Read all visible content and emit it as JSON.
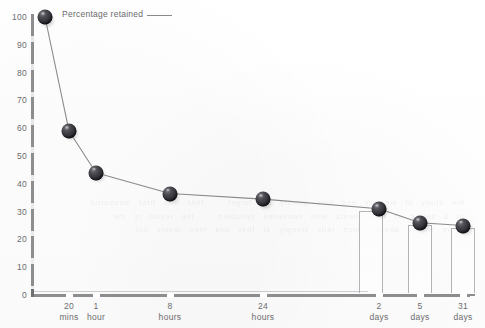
{
  "chart_data": {
    "type": "line",
    "title": "",
    "xlabel": "",
    "ylabel": "",
    "ylim": [
      0,
      100
    ],
    "grid": false,
    "legend_position": "top-left",
    "legend": [
      "Percentage retained"
    ],
    "categories": [
      "20\nmins",
      "1\nhour",
      "8\nhours",
      "24\nhours",
      "2\ndays",
      "5\ndays",
      "31\ndays"
    ],
    "x_tick_labels": [
      {
        "value": "20",
        "unit": "mins"
      },
      {
        "value": "1",
        "unit": "hour"
      },
      {
        "value": "8",
        "unit": "hours"
      },
      {
        "value": "24",
        "unit": "hours"
      },
      {
        "value": "2",
        "unit": "days"
      },
      {
        "value": "5",
        "unit": "days"
      },
      {
        "value": "31",
        "unit": "days"
      }
    ],
    "y_tick_labels": [
      "100",
      "90",
      "80",
      "70",
      "60",
      "50",
      "40",
      "30",
      "20",
      "10",
      "0"
    ],
    "y_ticks": [
      100,
      90,
      80,
      70,
      60,
      50,
      40,
      30,
      20,
      10,
      0
    ],
    "series": [
      {
        "name": "Percentage retained",
        "x": [
          "0",
          "20 mins",
          "1 hour",
          "8 hours",
          "24 hours",
          "2 days",
          "5 days",
          "31 days"
        ],
        "values": [
          100,
          59,
          44,
          36.5,
          34.5,
          31,
          26,
          25
        ]
      }
    ],
    "points": [
      {
        "label": "start",
        "x_px": 45,
        "value": 100
      },
      {
        "label": "20 mins",
        "x_px": 69,
        "value": 59
      },
      {
        "label": "1 hour",
        "x_px": 96,
        "value": 44
      },
      {
        "label": "8 hours",
        "x_px": 170,
        "value": 36.5
      },
      {
        "label": "24 hours",
        "x_px": 263,
        "value": 34.5
      },
      {
        "label": "2 days",
        "x_px": 379,
        "value": 31
      },
      {
        "label": "5 days",
        "x_px": 420,
        "value": 26
      },
      {
        "label": "31 days",
        "x_px": 463,
        "value": 25
      }
    ],
    "columns": [
      {
        "label": "2 days",
        "value": 31
      },
      {
        "label": "5 days",
        "value": 26
      },
      {
        "label": "31 days",
        "value": 25
      }
    ],
    "colors": {
      "marker": "#2a2a30",
      "line": "#8a8a8c",
      "axis": "#8d8d90",
      "text": "#6c6c6e",
      "background": "#ffffff",
      "column_border": "#b4b4b8"
    }
  },
  "legend": {
    "label": "Percentage retained",
    "swatch_name": "line-swatch"
  },
  "bleed_through": {
    "text": "the study of memory and how quickly we forget   that was first measured\nin a series of experiments with nonsense syllables   the result is the\ncurve shown above which falls steeply at first and then levels out"
  }
}
